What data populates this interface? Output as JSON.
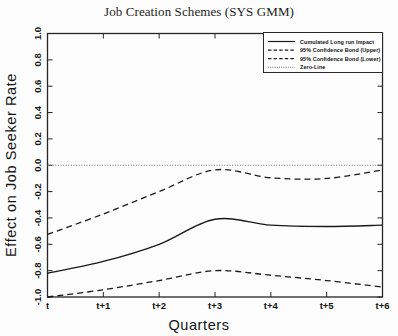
{
  "chart_data": {
    "type": "line",
    "title": "Job Creation Schemes (SYS GMM)",
    "xlabel": "Quarters",
    "ylabel": "Effect on Job Seeker Rate",
    "x": [
      "t",
      "t+1",
      "t+2",
      "t+3",
      "t+4",
      "t+5",
      "t+6"
    ],
    "xticklabels": [
      "t",
      "t+1",
      "t+2",
      "t+3",
      "t+4",
      "t+5",
      "t+6"
    ],
    "yticklabels": [
      "1.0",
      "0.8",
      "0.6",
      "0.4",
      "0.2",
      "0.0",
      "-0.2",
      "-0.4",
      "-0.6",
      "-0.8",
      "-1.0"
    ],
    "yticks": [
      1.0,
      0.8,
      0.6,
      0.4,
      0.2,
      0.0,
      -0.2,
      -0.4,
      -0.6,
      -0.8,
      -1.0
    ],
    "ylim": [
      -1.0,
      1.0
    ],
    "xlim": [
      0,
      6
    ],
    "grid": false,
    "legend_position": "top-right",
    "series": [
      {
        "name": "Cumulated Long run Impact",
        "style": "solid",
        "values": [
          -0.82,
          -0.73,
          -0.6,
          -0.41,
          -0.455,
          -0.465,
          -0.455
        ]
      },
      {
        "name": "95% Confidence Bond (Upper)",
        "style": "dashed",
        "values": [
          -0.525,
          -0.37,
          -0.2,
          -0.035,
          -0.095,
          -0.1,
          -0.035
        ]
      },
      {
        "name": "95% Confidence Bond (Lower)",
        "style": "dashed",
        "values": [
          -1.0,
          -0.945,
          -0.875,
          -0.8,
          -0.835,
          -0.875,
          -0.925
        ]
      },
      {
        "name": "Zero-Line",
        "style": "dotted",
        "values": [
          0.0,
          0.0,
          0.0,
          0.0,
          0.0,
          0.0,
          0.0
        ]
      }
    ]
  },
  "legend": {
    "entries": [
      {
        "label": "Cumulated Long run Impact",
        "style": "solid"
      },
      {
        "label": "95% Confidence Bond (Upper)",
        "style": "dashed"
      },
      {
        "label": "95% Confidence Bond (Lower)",
        "style": "dashed"
      },
      {
        "label": "Zero-Line",
        "style": "dotted"
      }
    ]
  }
}
